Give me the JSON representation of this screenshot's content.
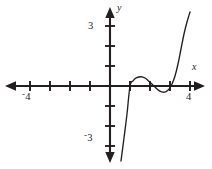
{
  "figure": {
    "kind": "cartesian-graph",
    "background": "#ffffff",
    "ink_color": "#231f20"
  },
  "axis_labels": {
    "x_axis_name": "x",
    "y_axis_name": "y"
  },
  "tick_labels": {
    "x_negative_four_sign": "-",
    "x_negative_four_value": "4",
    "x_positive_four": "4",
    "y_positive_three": "3",
    "y_negative_three_sign": "-",
    "y_negative_three_value": "3"
  },
  "chart_data": {
    "type": "line",
    "title": "",
    "xlabel": "x",
    "ylabel": "y",
    "xlim": [
      -5.1,
      4.6
    ],
    "ylim": [
      -3.9,
      3.7
    ],
    "xticks": [
      -4,
      -3,
      -2,
      -1,
      1,
      2,
      3,
      4
    ],
    "yticks": [
      -3,
      -2,
      -1,
      1,
      2,
      3
    ],
    "xtick_labels_shown": [
      "-4",
      "4"
    ],
    "ytick_labels_shown": [
      "3",
      "-3"
    ],
    "grid": false,
    "legend": false,
    "axis_arrows": [
      "left",
      "right",
      "up",
      "down"
    ],
    "origin_px": [
      110,
      86
    ],
    "pixels_per_unit": 20,
    "series": [
      {
        "name": "cubic-like polynomial",
        "description": "S-shaped curve rising from lower left, steeply increasing through a root near x=1, local maximum near x=1.6, local minimum near x=2.7, then rising steeply past a root near x=3.35",
        "roots": [
          1.0,
          2.2,
          3.35
        ],
        "local_maximum": {
          "x": 1.6,
          "y": 0.45
        },
        "local_minimum": {
          "x": 2.7,
          "y": -0.3
        },
        "x": [
          0.55,
          0.7,
          0.85,
          1.0,
          1.15,
          1.3,
          1.45,
          1.6,
          1.75,
          1.9,
          2.05,
          2.2,
          2.35,
          2.5,
          2.65,
          2.8,
          2.95,
          3.1,
          3.25,
          3.4,
          3.55,
          3.7,
          3.85,
          4.0
        ],
        "y": [
          -3.75,
          -2.6,
          -1.4,
          0.0,
          0.26,
          0.4,
          0.45,
          0.46,
          0.4,
          0.28,
          0.14,
          0.0,
          -0.15,
          -0.26,
          -0.31,
          -0.28,
          -0.16,
          0.1,
          0.5,
          1.1,
          1.85,
          2.6,
          3.2,
          3.7
        ]
      }
    ]
  }
}
